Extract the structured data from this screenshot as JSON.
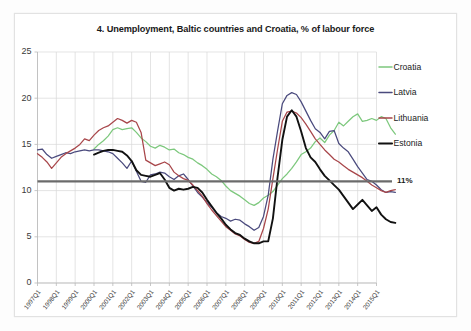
{
  "figure": {
    "title": "4. Unemployment, Baltic countries and Croatia, % of labour force"
  },
  "annotation": {
    "reference_label": "11%",
    "reference_value": 11,
    "reference_color": "#6b6b6b"
  },
  "legend": {
    "position": "right",
    "items": [
      {
        "label": "Croatia",
        "color": "#7dc87d"
      },
      {
        "label": "Latvia",
        "color": "#4a4a7d"
      },
      {
        "label": "Lithuania",
        "color": "#a8464a"
      },
      {
        "label": "Estonia",
        "color": "#111111"
      }
    ]
  },
  "chart_data": {
    "type": "line",
    "title": "4. Unemployment, Baltic countries and Croatia, % of labour force",
    "xlabel": "",
    "ylabel": "",
    "ylim": [
      0,
      25
    ],
    "yticks": [
      0,
      5,
      10,
      15,
      20,
      25
    ],
    "grid": true,
    "legend_position": "right",
    "annotations": [
      {
        "text": "11%",
        "type": "horizontal-reference-line",
        "value": 11,
        "color": "#6b6b6b"
      }
    ],
    "x_tick_labels": [
      "1997Q1",
      "1998Q1",
      "1999Q1",
      "2000Q1",
      "2001Q1",
      "2002Q1",
      "2003Q1",
      "2004Q1",
      "2005Q1",
      "2006Q1",
      "2007Q1",
      "2008Q1",
      "2009Q1",
      "2010Q1",
      "2011Q1",
      "2012Q1",
      "2013Q1",
      "2014Q1",
      "2015Q1"
    ],
    "x_start": "1997Q1",
    "x_end": "2015Q4",
    "x_frequency": "quarterly",
    "series": [
      {
        "name": "Croatia",
        "color": "#7dc87d",
        "values": [
          null,
          null,
          null,
          null,
          null,
          null,
          null,
          null,
          null,
          null,
          null,
          null,
          14.5,
          15.0,
          15.4,
          15.9,
          16.6,
          16.8,
          16.6,
          16.7,
          16.8,
          16.3,
          15.7,
          15.3,
          14.8,
          14.6,
          14.9,
          14.7,
          14.4,
          14.5,
          14.1,
          13.9,
          13.6,
          13.4,
          13.0,
          12.7,
          12.3,
          11.8,
          11.5,
          11.1,
          10.5,
          10.0,
          9.7,
          9.4,
          9.0,
          8.6,
          8.4,
          8.7,
          9.2,
          9.5,
          9.9,
          10.6,
          11.3,
          11.8,
          12.4,
          13.1,
          13.9,
          14.2,
          14.6,
          15.3,
          15.7,
          15.2,
          16.0,
          16.5,
          17.4,
          17.0,
          17.5,
          18.0,
          18.3,
          17.5,
          17.6,
          17.8,
          17.6,
          18.0,
          17.8,
          16.8,
          16.1
        ]
      },
      {
        "name": "Latvia",
        "color": "#4a4a7d",
        "values": [
          14.4,
          14.5,
          13.9,
          13.5,
          13.7,
          13.9,
          14.1,
          14.0,
          14.2,
          14.3,
          14.4,
          14.3,
          14.4,
          14.4,
          14.3,
          14.2,
          14.0,
          13.5,
          13.0,
          12.4,
          13.2,
          12.1,
          11.0,
          10.9,
          11.7,
          11.8,
          12.0,
          11.9,
          11.5,
          11.2,
          11.6,
          11.8,
          11.2,
          10.5,
          9.8,
          9.3,
          8.7,
          8.2,
          7.6,
          7.2,
          7.0,
          6.7,
          6.9,
          6.8,
          6.4,
          6.1,
          5.7,
          6.0,
          7.2,
          9.5,
          13.4,
          16.5,
          19.4,
          20.3,
          20.6,
          20.4,
          19.6,
          18.6,
          17.6,
          16.7,
          16.3,
          15.6,
          16.4,
          16.5,
          15.1,
          14.6,
          14.2,
          13.4,
          12.6,
          11.9,
          11.2,
          11.0,
          10.6,
          10.1,
          9.8,
          9.9,
          9.8
        ]
      },
      {
        "name": "Lithuania",
        "color": "#a8464a",
        "values": [
          14.0,
          13.6,
          13.1,
          12.4,
          13.0,
          13.6,
          14.0,
          14.3,
          14.6,
          15.0,
          15.6,
          15.4,
          16.0,
          16.5,
          16.8,
          17.0,
          17.4,
          17.8,
          17.6,
          17.3,
          17.6,
          17.4,
          16.3,
          13.3,
          13.0,
          12.7,
          12.9,
          13.1,
          12.8,
          12.0,
          11.6,
          11.3,
          11.1,
          10.6,
          10.0,
          9.4,
          8.6,
          7.9,
          7.3,
          6.7,
          6.1,
          5.7,
          5.3,
          5.1,
          4.7,
          4.4,
          4.3,
          4.5,
          5.9,
          8.0,
          11.3,
          14.5,
          17.5,
          18.5,
          18.6,
          18.4,
          17.9,
          17.2,
          16.4,
          15.6,
          15.0,
          14.4,
          13.9,
          13.4,
          13.1,
          12.7,
          12.3,
          12.0,
          11.7,
          11.4,
          11.0,
          10.6,
          10.3,
          10.0,
          9.8,
          10.0,
          10.1
        ]
      },
      {
        "name": "Estonia",
        "color": "#111111",
        "values": [
          null,
          null,
          null,
          null,
          null,
          null,
          null,
          null,
          null,
          null,
          null,
          null,
          13.9,
          14.1,
          14.3,
          14.4,
          14.4,
          14.3,
          14.2,
          13.8,
          13.2,
          12.2,
          11.7,
          11.6,
          11.5,
          11.7,
          11.9,
          11.2,
          10.3,
          10.0,
          10.2,
          10.1,
          10.2,
          10.4,
          10.3,
          9.8,
          9.0,
          8.3,
          7.6,
          7.0,
          6.3,
          5.8,
          5.4,
          5.2,
          4.8,
          4.5,
          4.3,
          4.3,
          4.5,
          4.5,
          7.0,
          11.5,
          15.5,
          18.0,
          18.7,
          18.0,
          16.4,
          14.6,
          13.6,
          13.1,
          12.3,
          11.6,
          11.1,
          10.6,
          10.1,
          9.4,
          8.7,
          8.0,
          8.5,
          9.0,
          8.4,
          7.8,
          8.2,
          7.4,
          6.9,
          6.6,
          6.5
        ]
      }
    ]
  }
}
